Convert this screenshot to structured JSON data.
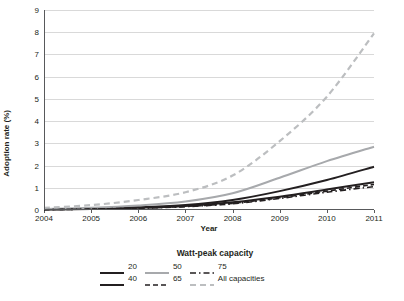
{
  "chart_data": {
    "type": "line",
    "title": "",
    "xlabel": "Year",
    "ylabel": "Adoption rate (%)",
    "xlim": [
      2004,
      2011
    ],
    "ylim": [
      0,
      9
    ],
    "grid": true,
    "legend_position": "bottom",
    "legend_title": "Watt-peak capacity",
    "x": [
      2004,
      2005,
      2006,
      2007,
      2008,
      2009,
      2010,
      2011
    ],
    "xticklabels": [
      "2004",
      "2005",
      "2006",
      "2007",
      "2008",
      "2009",
      "2010",
      "2011"
    ],
    "yticklabels": [
      "0",
      "1",
      "2",
      "3",
      "4",
      "5",
      "6",
      "7",
      "8",
      "9"
    ],
    "series": [
      {
        "name": "20",
        "style": "solid-dark",
        "color": "#231f20",
        "values": [
          0.03,
          0.06,
          0.12,
          0.22,
          0.45,
          0.85,
          1.35,
          1.95
        ]
      },
      {
        "name": "40",
        "style": "solid-dark",
        "color": "#231f20",
        "values": [
          0.02,
          0.05,
          0.1,
          0.18,
          0.35,
          0.6,
          0.92,
          1.25
        ]
      },
      {
        "name": "50",
        "style": "solid-gray",
        "color": "#a7a9ac",
        "values": [
          0.05,
          0.1,
          0.2,
          0.38,
          0.75,
          1.45,
          2.2,
          2.85
        ]
      },
      {
        "name": "65",
        "style": "dashed-dark",
        "color": "#231f20",
        "values": [
          0.02,
          0.04,
          0.09,
          0.16,
          0.3,
          0.55,
          0.85,
          1.15
        ]
      },
      {
        "name": "75",
        "style": "dash-dot-dark",
        "color": "#231f20",
        "values": [
          0.02,
          0.04,
          0.08,
          0.15,
          0.28,
          0.52,
          0.8,
          1.05
        ]
      },
      {
        "name": "All capacities",
        "style": "dashed-gray",
        "color": "#bcbec0",
        "values": [
          0.1,
          0.22,
          0.45,
          0.8,
          1.55,
          3.1,
          5.1,
          7.95
        ]
      }
    ]
  },
  "legend": {
    "title": "Watt-peak capacity",
    "rows": [
      [
        {
          "label": "20",
          "style": "solid-dark"
        },
        {
          "label": "50",
          "style": "solid-gray"
        },
        {
          "label": "75",
          "style": "dash-dot-dark"
        }
      ],
      [
        {
          "label": "40",
          "style": "solid-dark"
        },
        {
          "label": "65",
          "style": "dashed-dark"
        },
        {
          "label": "All capacities",
          "style": "dashed-gray"
        }
      ]
    ]
  }
}
